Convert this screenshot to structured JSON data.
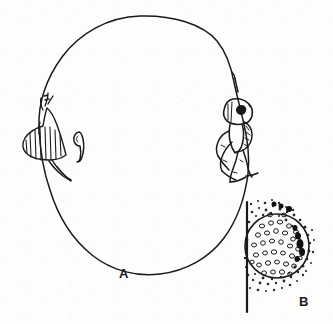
{
  "plate": {
    "caption_labels": [
      {
        "id": "A",
        "text": "A",
        "description": "large oval outline with attached organisms"
      },
      {
        "id": "B",
        "text": "B",
        "description": "detail of granular spherical body on substrate line"
      }
    ],
    "background_color": "#fdfdfb",
    "ink_color": "#1a1a1a",
    "figure_a": {
      "name": "oval-outline-figure",
      "outline_shape": "irregular hand-drawn oval",
      "elements": [
        {
          "name": "left-striped-wedge",
          "description": "hatched wedge-shaped body attached to left margin of oval"
        },
        {
          "name": "left-wedge-tail",
          "description": "small pointed appendage below the striped wedge"
        },
        {
          "name": "central-comma-mark",
          "description": "small teardrop or comma shaped mark inside the oval"
        },
        {
          "name": "right-insect-figure",
          "description": "insect-like body with head, thorax and legs clinging to right margin of oval"
        }
      ]
    },
    "figure_b": {
      "name": "granular-body-detail",
      "elements": [
        {
          "name": "substrate-line",
          "description": "vertical straight line at left"
        },
        {
          "name": "granular-sphere",
          "description": "circle filled with small oval granules"
        },
        {
          "name": "stipple-halo",
          "description": "dark stippled texture surrounding the circle"
        }
      ]
    }
  }
}
